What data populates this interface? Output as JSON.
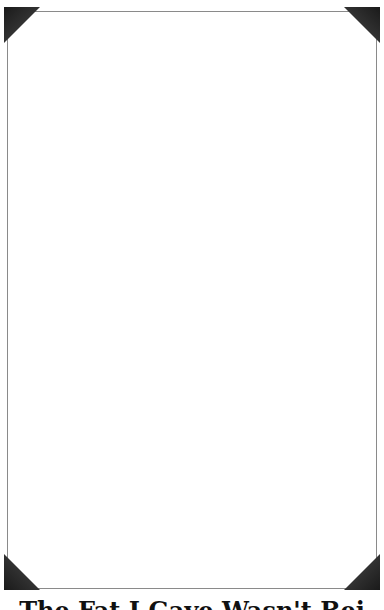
{
  "document": {
    "title": "The Fat I Gave Wasn't Bei",
    "frame_color": "#8a8a8a",
    "corner_color": "#2a2a2a",
    "background": "#ffffff"
  }
}
